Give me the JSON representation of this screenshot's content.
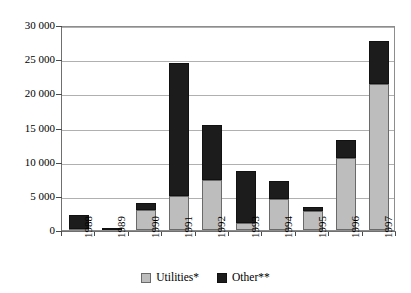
{
  "title": "",
  "legend": {
    "position": "bottom-center",
    "entries": [
      {
        "key": "utilities",
        "label": "Utilities*",
        "color": "#bdbdbd"
      },
      {
        "key": "other",
        "label": "Other**",
        "color": "#1c1c1c"
      }
    ]
  },
  "axis": {
    "y_ticks": [
      "0",
      "5 000",
      "10 000",
      "15 000",
      "20 000",
      "25 000",
      "30 000"
    ],
    "x_ticks": [
      "1988",
      "1989",
      "1990",
      "1991",
      "1992",
      "1993",
      "1994",
      "1995",
      "1996",
      "1997"
    ]
  },
  "chart_data": {
    "type": "bar",
    "title": "",
    "xlabel": "",
    "ylabel": "",
    "stacked": true,
    "grid": true,
    "legend_position": "bottom-center",
    "ylim": [
      0,
      30000
    ],
    "ytick_values": [
      0,
      5000,
      10000,
      15000,
      20000,
      25000,
      30000
    ],
    "ytick_labels": [
      "0",
      "5 000",
      "10 000",
      "15 000",
      "20 000",
      "25 000",
      "30 000"
    ],
    "categories": [
      "1988",
      "1989",
      "1990",
      "1991",
      "1992",
      "1993",
      "1994",
      "1995",
      "1996",
      "1997"
    ],
    "series": [
      {
        "name": "Utilities*",
        "color": "#bdbdbd",
        "values": [
          200,
          0,
          3000,
          5000,
          7300,
          1000,
          4500,
          2800,
          10500,
          21300
        ]
      },
      {
        "name": "Other**",
        "color": "#1c1c1c",
        "values": [
          2000,
          300,
          1000,
          19500,
          8000,
          7700,
          2700,
          600,
          2700,
          6400
        ]
      }
    ],
    "totals": [
      2200,
      300,
      4000,
      24500,
      15300,
      8700,
      7200,
      3400,
      13200,
      27700
    ]
  }
}
